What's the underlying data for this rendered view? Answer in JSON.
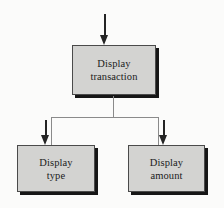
{
  "diagram": {
    "type": "structure-chart",
    "background_color": "#fbfbfa",
    "node_fill_color": "#d3d3d1",
    "node_border_color": "#4a4a4a",
    "node_shadow_color": "#161616",
    "connector_color": "#8a8a8a",
    "arrow_color": "#242424",
    "nodes": [
      {
        "id": "root",
        "line1": "Display",
        "line2": "transaction"
      },
      {
        "id": "type",
        "line1": "Display",
        "line2": "type"
      },
      {
        "id": "amount",
        "line1": "Display",
        "line2": "amount"
      }
    ],
    "arrows": [
      {
        "id": "into-root",
        "direction": "down",
        "target": "Display transaction"
      },
      {
        "id": "into-type",
        "direction": "down",
        "target": "Display type"
      },
      {
        "id": "into-amount",
        "direction": "down",
        "target": "Display amount"
      }
    ]
  }
}
